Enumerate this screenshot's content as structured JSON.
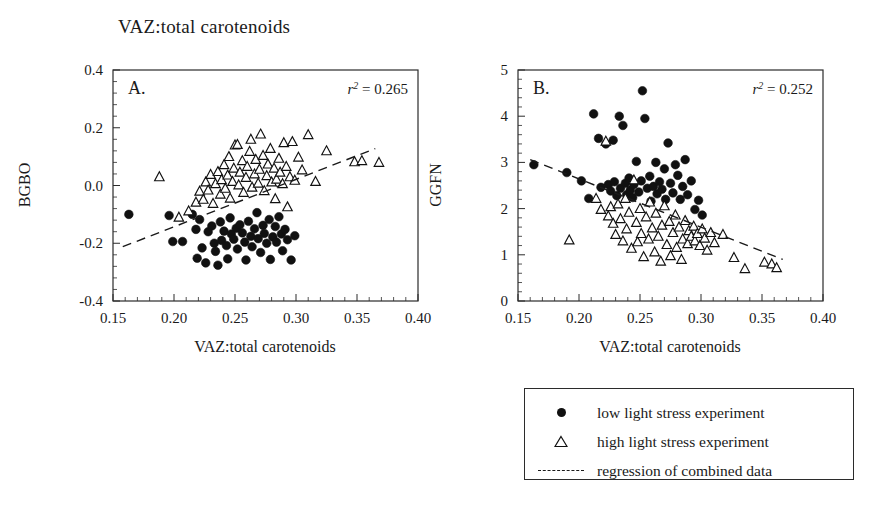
{
  "figure": {
    "title": "VAZ:total carotenoids",
    "legend": {
      "items": [
        {
          "key": "filled-circle",
          "label": "low light stress experiment"
        },
        {
          "key": "open-triangle",
          "label": "high light stress experiment"
        },
        {
          "key": "dashed-line",
          "label": "regression of combined data"
        }
      ]
    }
  },
  "chart_data": [
    {
      "type": "scatter",
      "panel": "A.",
      "title": "VAZ:total carotenoids",
      "xlabel": "VAZ:total carotenoids",
      "ylabel": "BGBO",
      "xlim": [
        0.15,
        0.4
      ],
      "ylim": [
        -0.4,
        0.4
      ],
      "xticks": [
        0.15,
        0.2,
        0.25,
        0.3,
        0.35,
        0.4
      ],
      "xticklabels": [
        "0.15",
        "0.20",
        "0.25",
        "0.30",
        "0.35",
        "0.40"
      ],
      "yticks": [
        -0.4,
        -0.2,
        0.0,
        0.2,
        0.4
      ],
      "yticklabels": [
        "-0.4",
        "-0.2",
        "0.0",
        "0.2",
        "0.4"
      ],
      "grid": false,
      "annotation": "r2 = 0.265",
      "r_squared": 0.265,
      "legend_position": "external-below-right",
      "series": [
        {
          "name": "low light stress experiment",
          "marker": "filled-circle",
          "color": "#111111",
          "points": [
            [
              0.163,
              -0.1
            ],
            [
              0.196,
              -0.104
            ],
            [
              0.199,
              -0.194
            ],
            [
              0.207,
              -0.194
            ],
            [
              0.215,
              -0.1
            ],
            [
              0.218,
              -0.152
            ],
            [
              0.219,
              -0.252
            ],
            [
              0.221,
              -0.118
            ],
            [
              0.223,
              -0.216
            ],
            [
              0.226,
              -0.268
            ],
            [
              0.228,
              -0.16
            ],
            [
              0.231,
              -0.14
            ],
            [
              0.233,
              -0.2
            ],
            [
              0.234,
              -0.228
            ],
            [
              0.236,
              -0.276
            ],
            [
              0.238,
              -0.126
            ],
            [
              0.239,
              -0.19
            ],
            [
              0.241,
              -0.158
            ],
            [
              0.243,
              -0.208
            ],
            [
              0.244,
              -0.254
            ],
            [
              0.246,
              -0.112
            ],
            [
              0.247,
              -0.168
            ],
            [
              0.249,
              -0.186
            ],
            [
              0.251,
              -0.148
            ],
            [
              0.252,
              -0.22
            ],
            [
              0.254,
              -0.136
            ],
            [
              0.256,
              -0.164
            ],
            [
              0.258,
              -0.196
            ],
            [
              0.259,
              -0.258
            ],
            [
              0.261,
              -0.124
            ],
            [
              0.263,
              -0.176
            ],
            [
              0.264,
              -0.212
            ],
            [
              0.266,
              -0.15
            ],
            [
              0.268,
              -0.094
            ],
            [
              0.269,
              -0.184
            ],
            [
              0.271,
              -0.232
            ],
            [
              0.273,
              -0.138
            ],
            [
              0.274,
              -0.166
            ],
            [
              0.276,
              -0.2
            ],
            [
              0.278,
              -0.118
            ],
            [
              0.279,
              -0.256
            ],
            [
              0.281,
              -0.178
            ],
            [
              0.283,
              -0.142
            ],
            [
              0.284,
              -0.196
            ],
            [
              0.286,
              -0.108
            ],
            [
              0.288,
              -0.168
            ],
            [
              0.289,
              -0.226
            ],
            [
              0.291,
              -0.152
            ],
            [
              0.293,
              -0.188
            ],
            [
              0.296,
              -0.258
            ],
            [
              0.299,
              -0.174
            ]
          ]
        },
        {
          "name": "high light stress experiment",
          "marker": "open-triangle",
          "color": "#111111",
          "points": [
            [
              0.188,
              0.03
            ],
            [
              0.204,
              -0.11
            ],
            [
              0.212,
              -0.088
            ],
            [
              0.218,
              -0.058
            ],
            [
              0.221,
              -0.02
            ],
            [
              0.224,
              -0.048
            ],
            [
              0.226,
              0.012
            ],
            [
              0.228,
              -0.016
            ],
            [
              0.23,
              0.038
            ],
            [
              0.232,
              -0.062
            ],
            [
              0.234,
              0.006
            ],
            [
              0.236,
              0.048
            ],
            [
              0.238,
              -0.03
            ],
            [
              0.239,
              0.02
            ],
            [
              0.241,
              0.072
            ],
            [
              0.242,
              -0.01
            ],
            [
              0.244,
              0.036
            ],
            [
              0.245,
              0.1
            ],
            [
              0.246,
              -0.044
            ],
            [
              0.248,
              0.014
            ],
            [
              0.249,
              0.06
            ],
            [
              0.25,
              0.14
            ],
            [
              0.252,
              0.142
            ],
            [
              0.253,
              0.002
            ],
            [
              0.254,
              0.046
            ],
            [
              0.256,
              0.086
            ],
            [
              0.257,
              -0.024
            ],
            [
              0.259,
              0.028
            ],
            [
              0.26,
              0.066
            ],
            [
              0.262,
              0.118
            ],
            [
              0.263,
              0.16
            ],
            [
              0.264,
              -0.006
            ],
            [
              0.266,
              0.04
            ],
            [
              0.267,
              0.09
            ],
            [
              0.269,
              0.008
            ],
            [
              0.27,
              0.056
            ],
            [
              0.271,
              0.178
            ],
            [
              0.273,
              0.104
            ],
            [
              0.274,
              -0.018
            ],
            [
              0.276,
              0.034
            ],
            [
              0.277,
              0.074
            ],
            [
              0.279,
              0.128
            ],
            [
              0.28,
              0.012
            ],
            [
              0.282,
              0.06
            ],
            [
              0.283,
              -0.046
            ],
            [
              0.284,
              0.022
            ],
            [
              0.286,
              0.094
            ],
            [
              0.287,
              0.046
            ],
            [
              0.289,
              0.006
            ],
            [
              0.29,
              0.148
            ],
            [
              0.292,
              0.066
            ],
            [
              0.293,
              -0.074
            ],
            [
              0.295,
              0.03
            ],
            [
              0.297,
              0.152
            ],
            [
              0.299,
              0.018
            ],
            [
              0.302,
              0.098
            ],
            [
              0.305,
              0.054
            ],
            [
              0.31,
              0.176
            ],
            [
              0.316,
              0.014
            ],
            [
              0.325,
              0.12
            ],
            [
              0.348,
              0.082
            ],
            [
              0.354,
              0.086
            ],
            [
              0.368,
              0.08
            ]
          ]
        }
      ],
      "regression": {
        "x": [
          0.158,
          0.365
        ],
        "y": [
          -0.212,
          0.128
        ],
        "style": "dashed"
      }
    },
    {
      "type": "scatter",
      "panel": "B.",
      "title": "VAZ:total carotenoids",
      "xlabel": "VAZ:total carotenoids",
      "ylabel": "GGFN",
      "xlim": [
        0.15,
        0.4
      ],
      "ylim": [
        0,
        5
      ],
      "xticks": [
        0.15,
        0.2,
        0.25,
        0.3,
        0.35,
        0.4
      ],
      "xticklabels": [
        "0.15",
        "0.20",
        "0.25",
        "0.30",
        "0.35",
        "0.40"
      ],
      "yticks": [
        0,
        1,
        2,
        3,
        4,
        5
      ],
      "yticklabels": [
        "0",
        "1",
        "2",
        "3",
        "4",
        "5"
      ],
      "grid": false,
      "annotation": "r2 = 0.252",
      "r_squared": 0.252,
      "legend_position": "external-below-right",
      "series": [
        {
          "name": "low light stress experiment",
          "marker": "filled-circle",
          "color": "#111111",
          "points": [
            [
              0.163,
              2.95
            ],
            [
              0.19,
              2.78
            ],
            [
              0.202,
              2.6
            ],
            [
              0.208,
              2.22
            ],
            [
              0.212,
              4.05
            ],
            [
              0.216,
              3.52
            ],
            [
              0.218,
              2.46
            ],
            [
              0.222,
              3.4
            ],
            [
              0.224,
              2.52
            ],
            [
              0.226,
              2.38
            ],
            [
              0.228,
              3.48
            ],
            [
              0.229,
              2.58
            ],
            [
              0.231,
              2.28
            ],
            [
              0.233,
              4.0
            ],
            [
              0.234,
              2.44
            ],
            [
              0.236,
              3.8
            ],
            [
              0.238,
              2.55
            ],
            [
              0.239,
              2.3
            ],
            [
              0.241,
              2.66
            ],
            [
              0.242,
              2.4
            ],
            [
              0.244,
              2.24
            ],
            [
              0.245,
              2.52
            ],
            [
              0.247,
              3.02
            ],
            [
              0.249,
              2.36
            ],
            [
              0.251,
              2.6
            ],
            [
              0.252,
              4.55
            ],
            [
              0.254,
              3.95
            ],
            [
              0.256,
              2.44
            ],
            [
              0.258,
              2.7
            ],
            [
              0.259,
              2.16
            ],
            [
              0.261,
              2.48
            ],
            [
              0.263,
              3.0
            ],
            [
              0.264,
              2.32
            ],
            [
              0.266,
              2.58
            ],
            [
              0.268,
              2.42
            ],
            [
              0.27,
              2.86
            ],
            [
              0.271,
              2.2
            ],
            [
              0.273,
              3.42
            ],
            [
              0.275,
              2.55
            ],
            [
              0.277,
              2.34
            ],
            [
              0.279,
              2.95
            ],
            [
              0.281,
              2.72
            ],
            [
              0.283,
              2.2
            ],
            [
              0.285,
              2.48
            ],
            [
              0.287,
              3.06
            ],
            [
              0.289,
              2.3
            ],
            [
              0.292,
              2.6
            ],
            [
              0.295,
              1.98
            ],
            [
              0.298,
              2.18
            ],
            [
              0.301,
              1.86
            ]
          ]
        },
        {
          "name": "high light stress experiment",
          "marker": "open-triangle",
          "color": "#111111",
          "points": [
            [
              0.192,
              1.32
            ],
            [
              0.214,
              2.22
            ],
            [
              0.218,
              1.98
            ],
            [
              0.222,
              3.46
            ],
            [
              0.224,
              1.84
            ],
            [
              0.226,
              2.04
            ],
            [
              0.228,
              1.68
            ],
            [
              0.23,
              1.44
            ],
            [
              0.232,
              2.1
            ],
            [
              0.234,
              1.78
            ],
            [
              0.236,
              1.3
            ],
            [
              0.238,
              2.22
            ],
            [
              0.239,
              1.56
            ],
            [
              0.241,
              1.92
            ],
            [
              0.243,
              1.14
            ],
            [
              0.245,
              2.62
            ],
            [
              0.247,
              1.7
            ],
            [
              0.248,
              1.28
            ],
            [
              0.25,
              2.0
            ],
            [
              0.251,
              1.46
            ],
            [
              0.253,
              0.96
            ],
            [
              0.255,
              1.82
            ],
            [
              0.257,
              1.34
            ],
            [
              0.258,
              2.14
            ],
            [
              0.26,
              1.58
            ],
            [
              0.262,
              1.06
            ],
            [
              0.263,
              1.9
            ],
            [
              0.265,
              1.4
            ],
            [
              0.267,
              0.86
            ],
            [
              0.268,
              1.64
            ],
            [
              0.27,
              2.06
            ],
            [
              0.272,
              1.22
            ],
            [
              0.274,
              1.72
            ],
            [
              0.275,
              0.98
            ],
            [
              0.277,
              1.48
            ],
            [
              0.279,
              1.86
            ],
            [
              0.28,
              1.16
            ],
            [
              0.282,
              1.6
            ],
            [
              0.284,
              0.9
            ],
            [
              0.285,
              1.34
            ],
            [
              0.287,
              1.74
            ],
            [
              0.289,
              1.24
            ],
            [
              0.29,
              1.52
            ],
            [
              0.292,
              1.4
            ],
            [
              0.294,
              1.62
            ],
            [
              0.295,
              1.3
            ],
            [
              0.297,
              1.46
            ],
            [
              0.299,
              1.2
            ],
            [
              0.301,
              1.56
            ],
            [
              0.303,
              1.36
            ],
            [
              0.305,
              1.1
            ],
            [
              0.308,
              1.48
            ],
            [
              0.311,
              1.26
            ],
            [
              0.318,
              1.44
            ],
            [
              0.327,
              0.94
            ],
            [
              0.336,
              0.7
            ],
            [
              0.352,
              0.84
            ],
            [
              0.358,
              0.8
            ],
            [
              0.362,
              0.72
            ]
          ]
        }
      ],
      "regression": {
        "x": [
          0.16,
          0.367
        ],
        "y": [
          3.06,
          0.9
        ],
        "style": "dashed"
      }
    }
  ]
}
